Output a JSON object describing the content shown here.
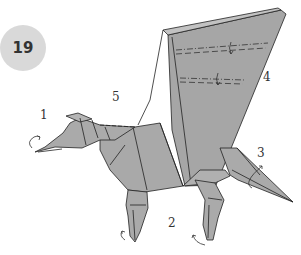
{
  "step": {
    "number": "19"
  },
  "labels": [
    {
      "id": "1",
      "text": "1",
      "x": 40,
      "y": 108
    },
    {
      "id": "2",
      "text": "2",
      "x": 168,
      "y": 216
    },
    {
      "id": "3",
      "text": "3",
      "x": 257,
      "y": 146
    },
    {
      "id": "4",
      "text": "4",
      "x": 263,
      "y": 70
    },
    {
      "id": "5",
      "text": "5",
      "x": 112,
      "y": 90
    }
  ],
  "colors": {
    "paper": "#a9a9a9",
    "paper_light": "#c2c2c2",
    "line": "#222222",
    "badge": "#d9d9d9"
  }
}
